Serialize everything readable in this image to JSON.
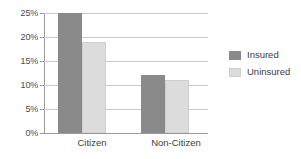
{
  "chart_data": {
    "type": "bar",
    "title": "",
    "xlabel": "",
    "ylabel": "",
    "categories": [
      "Citizen",
      "Non-Citizen"
    ],
    "series": [
      {
        "name": "Insured",
        "values": [
          25,
          12
        ],
        "color": "#8a8a8a"
      },
      {
        "name": "Uninsured",
        "values": [
          19,
          11
        ],
        "color": "#dcdcdc"
      }
    ],
    "ylim": [
      0,
      25
    ],
    "ytick_labels": [
      "0%",
      "5%",
      "10%",
      "15%",
      "20%",
      "25%"
    ],
    "ytick_values": [
      0,
      5,
      10,
      15,
      20,
      25
    ],
    "grid": true,
    "legend_position": "right"
  },
  "legend": {
    "items": [
      {
        "label": "Insured",
        "swatch": "insured-swatch"
      },
      {
        "label": "Uninsured",
        "swatch": "uninsured-swatch"
      }
    ]
  },
  "axes": {
    "y_ticks": [
      "25%",
      "20%",
      "15%",
      "10%",
      "5%",
      "0%"
    ],
    "x_ticks": [
      "Citizen",
      "Non-Citizen"
    ]
  }
}
